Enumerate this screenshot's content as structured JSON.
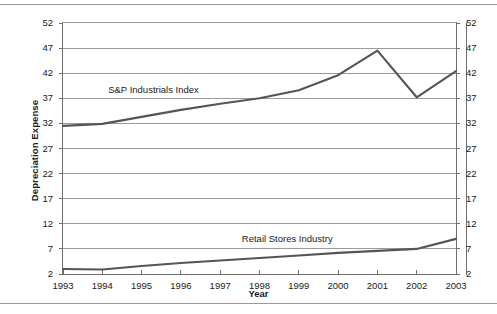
{
  "chart_data": {
    "type": "line",
    "title": "",
    "xlabel": "Year",
    "ylabel": "Depreciation Expense",
    "categories": [
      "1993",
      "1994",
      "1995",
      "1996",
      "1997",
      "1998",
      "1999",
      "2000",
      "2001",
      "2002",
      "2003"
    ],
    "x": [
      1993,
      1994,
      1995,
      1996,
      1997,
      1998,
      1999,
      2000,
      2001,
      2002,
      2003
    ],
    "xlim": [
      1993,
      2003
    ],
    "ylim": [
      2,
      52
    ],
    "yticks": [
      2,
      7,
      12,
      17,
      22,
      27,
      32,
      37,
      42,
      47,
      52
    ],
    "ytick_labels": [
      "2",
      "7",
      "12",
      "17",
      "22",
      "27",
      "32",
      "37",
      "42",
      "47",
      "52"
    ],
    "grid": "horizontal",
    "legend": "inline-annotations",
    "mirrored_y_axis": true,
    "series": [
      {
        "name": "S&P Industrials Index",
        "color": "#555555",
        "values": [
          31.5,
          31.9,
          33.3,
          34.7,
          35.9,
          37.0,
          38.6,
          41.6,
          46.5,
          37.2,
          42.4
        ],
        "annotation": "S&P Industrials Index"
      },
      {
        "name": "Retail Stores Industry",
        "color": "#555555",
        "values": [
          3.0,
          2.9,
          3.6,
          4.2,
          4.7,
          5.2,
          5.7,
          6.2,
          6.6,
          7.0,
          9.0
        ],
        "annotation": "Retail Stores Industry"
      }
    ],
    "annotations": [
      {
        "text": "S&P Industrials Index",
        "x": 1994.15,
        "y": 38.6
      },
      {
        "text": "Retail Stores Industry",
        "x": 1997.55,
        "y": 9.0
      }
    ]
  },
  "axes": {
    "y_title": "Depreciation Expense",
    "x_title": "Year"
  },
  "colors": {
    "line": "#555555",
    "grid": "#9b9b9b",
    "frame": "#6e6e6e",
    "text": "#1a1a1a",
    "rule": "#9a9a9a"
  }
}
